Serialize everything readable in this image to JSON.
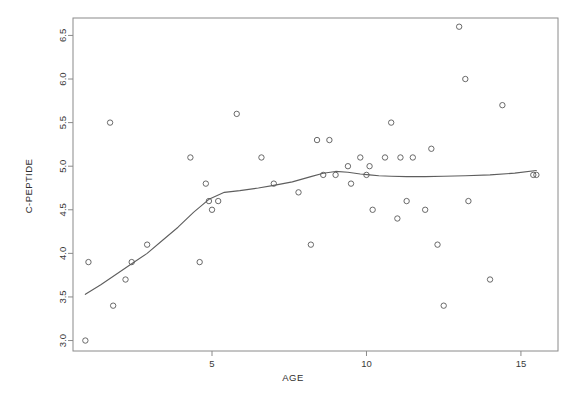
{
  "chart_data": {
    "type": "scatter",
    "title": "",
    "xlabel": "AGE",
    "ylabel": "C-PEPTIDE",
    "xlim": [
      0.5,
      16.2
    ],
    "ylim": [
      2.88,
      6.7
    ],
    "grid": false,
    "legend": null,
    "x_ticks": [
      5,
      10,
      15
    ],
    "x_tick_labels": [
      "5",
      "10",
      "15"
    ],
    "y_ticks": [
      3.0,
      3.5,
      4.0,
      4.5,
      5.0,
      5.5,
      6.0,
      6.5
    ],
    "y_tick_labels": [
      "3.0",
      "3.5",
      "4.0",
      "4.5",
      "5.0",
      "5.5",
      "6.0",
      "6.5"
    ],
    "points": [
      {
        "x": 0.9,
        "y": 3.0
      },
      {
        "x": 1.0,
        "y": 3.9
      },
      {
        "x": 1.7,
        "y": 5.5
      },
      {
        "x": 1.8,
        "y": 3.4
      },
      {
        "x": 2.2,
        "y": 3.7
      },
      {
        "x": 2.4,
        "y": 3.9
      },
      {
        "x": 2.9,
        "y": 4.1
      },
      {
        "x": 4.3,
        "y": 5.1
      },
      {
        "x": 4.6,
        "y": 3.9
      },
      {
        "x": 4.8,
        "y": 4.8
      },
      {
        "x": 4.9,
        "y": 4.6
      },
      {
        "x": 5.0,
        "y": 4.5
      },
      {
        "x": 5.2,
        "y": 4.6
      },
      {
        "x": 5.8,
        "y": 5.6
      },
      {
        "x": 6.6,
        "y": 5.1
      },
      {
        "x": 7.0,
        "y": 4.8
      },
      {
        "x": 7.8,
        "y": 4.7
      },
      {
        "x": 8.2,
        "y": 4.1
      },
      {
        "x": 8.4,
        "y": 5.3
      },
      {
        "x": 8.6,
        "y": 4.9
      },
      {
        "x": 8.8,
        "y": 5.3
      },
      {
        "x": 9.0,
        "y": 4.9
      },
      {
        "x": 9.4,
        "y": 5.0
      },
      {
        "x": 9.5,
        "y": 4.8
      },
      {
        "x": 9.8,
        "y": 5.1
      },
      {
        "x": 10.0,
        "y": 4.9
      },
      {
        "x": 10.1,
        "y": 5.0
      },
      {
        "x": 10.2,
        "y": 4.5
      },
      {
        "x": 10.6,
        "y": 5.1
      },
      {
        "x": 10.8,
        "y": 5.5
      },
      {
        "x": 11.0,
        "y": 4.4
      },
      {
        "x": 11.1,
        "y": 5.1
      },
      {
        "x": 11.3,
        "y": 4.6
      },
      {
        "x": 11.5,
        "y": 5.1
      },
      {
        "x": 11.9,
        "y": 4.5
      },
      {
        "x": 12.1,
        "y": 5.2
      },
      {
        "x": 12.3,
        "y": 4.1
      },
      {
        "x": 12.5,
        "y": 3.4
      },
      {
        "x": 13.0,
        "y": 6.6
      },
      {
        "x": 13.2,
        "y": 6.0
      },
      {
        "x": 13.3,
        "y": 4.6
      },
      {
        "x": 14.0,
        "y": 3.7
      },
      {
        "x": 14.4,
        "y": 5.7
      },
      {
        "x": 15.4,
        "y": 4.9
      },
      {
        "x": 15.5,
        "y": 4.9
      }
    ],
    "smoother": {
      "name": "lowess",
      "x": [
        0.9,
        1.4,
        1.9,
        2.4,
        2.9,
        3.4,
        3.9,
        4.4,
        4.9,
        5.4,
        5.9,
        6.5,
        7.0,
        7.6,
        8.2,
        8.6,
        9.0,
        9.4,
        9.8,
        10.1,
        10.4,
        10.8,
        11.3,
        11.9,
        12.5,
        13.2,
        14.0,
        14.8,
        15.5
      ],
      "y": [
        3.53,
        3.64,
        3.76,
        3.88,
        4.0,
        4.15,
        4.3,
        4.47,
        4.62,
        4.7,
        4.72,
        4.75,
        4.78,
        4.82,
        4.88,
        4.92,
        4.94,
        4.93,
        4.91,
        4.9,
        4.89,
        4.885,
        4.88,
        4.88,
        4.885,
        4.89,
        4.9,
        4.92,
        4.95
      ]
    }
  },
  "colors": {
    "point_stroke": "#595959",
    "line_stroke": "#5e5e5e",
    "frame": "#8a8a8a",
    "text": "#3a3a3a",
    "background": "#ffffff"
  }
}
